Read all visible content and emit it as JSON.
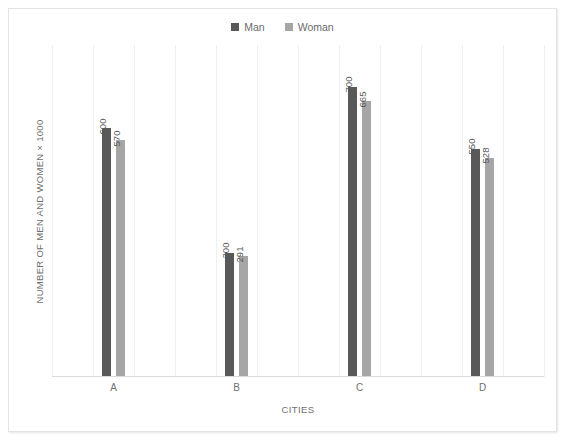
{
  "chart_data": {
    "type": "bar",
    "title": "",
    "categories": [
      "A",
      "B",
      "C",
      "D"
    ],
    "series": [
      {
        "name": "Man",
        "color": "#595959",
        "values": [
          600,
          300,
          700,
          550
        ]
      },
      {
        "name": "Woman",
        "color": "#a6a6a6",
        "values": [
          570,
          291,
          665,
          528
        ]
      }
    ],
    "xlabel": "CITIES",
    "ylabel": "NUMBER OF MEN AND WOMEN × 1000",
    "ylim": [
      0,
      800
    ],
    "y_tick_labels": [],
    "grid": {
      "vertical": true,
      "horizontal": false,
      "color": "#f0f0f0",
      "count": 12
    },
    "legend": {
      "position": "top-center",
      "entries": [
        "Man",
        "Woman"
      ]
    },
    "data_labels": {
      "shown": true,
      "rotation": -90,
      "values": [
        {
          "category": "A",
          "man": "600",
          "woman": "570"
        },
        {
          "category": "B",
          "man": "300",
          "woman": "291"
        },
        {
          "category": "C",
          "man": "700",
          "woman": "665"
        },
        {
          "category": "D",
          "man": "550",
          "woman": "528"
        }
      ]
    }
  },
  "legend": {
    "entries": [
      {
        "label": "Man",
        "color": "#595959"
      },
      {
        "label": "Woman",
        "color": "#a6a6a6"
      }
    ]
  },
  "axes": {
    "x_title": "CITIES",
    "y_title": "NUMBER OF MEN AND WOMEN × 1000",
    "x_ticks": [
      "A",
      "B",
      "C",
      "D"
    ]
  }
}
